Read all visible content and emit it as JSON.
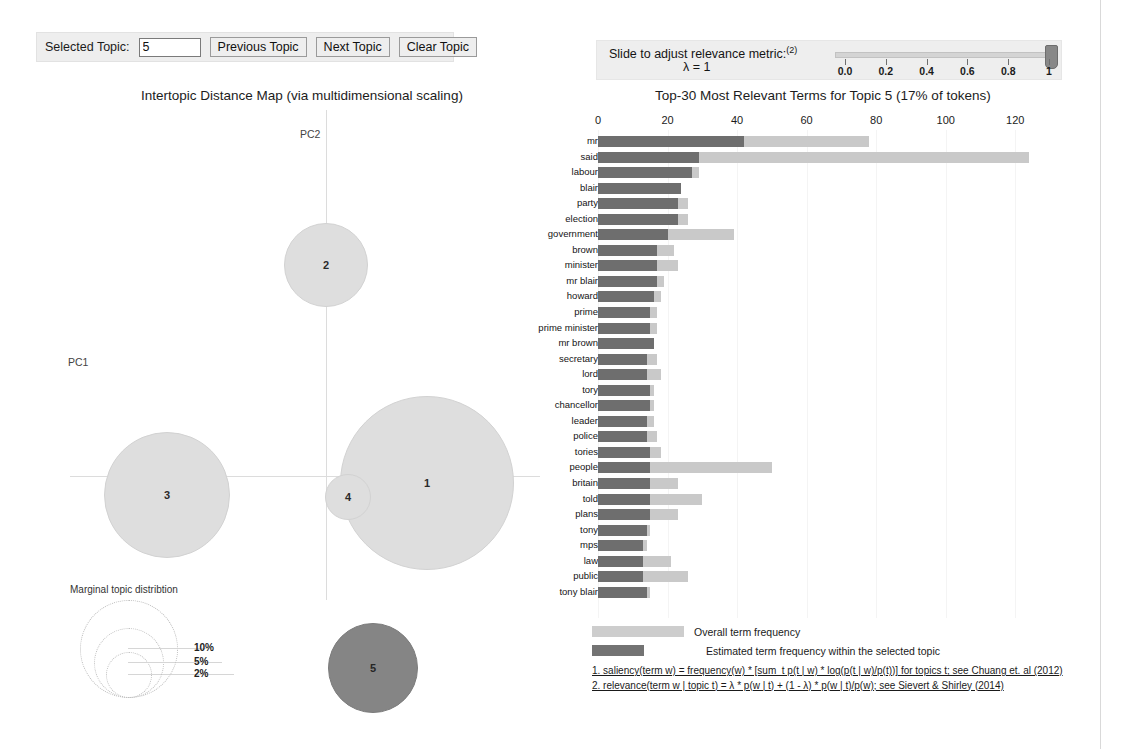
{
  "controls": {
    "selected_topic_label": "Selected Topic:",
    "selected_topic_value": "5",
    "previous_button": "Previous Topic",
    "next_button": "Next Topic",
    "clear_button": "Clear Topic"
  },
  "slider": {
    "label": "Slide to adjust relevance metric:",
    "superscript": "(2)",
    "lambda_text": "λ = 1",
    "value": 1,
    "ticks": [
      "0.0",
      "0.2",
      "0.4",
      "0.6",
      "0.8",
      "1"
    ]
  },
  "idm": {
    "title": "Intertopic Distance Map (via multidimensional scaling)",
    "pc1_label": "PC1",
    "pc2_label": "PC2",
    "topics": [
      {
        "id": "1",
        "cx": 406,
        "cy": 378,
        "r": 86,
        "selected": false
      },
      {
        "id": "2",
        "cx": 305,
        "cy": 160,
        "r": 41,
        "selected": false
      },
      {
        "id": "3",
        "cx": 146,
        "cy": 390,
        "r": 62,
        "selected": false
      },
      {
        "id": "4",
        "cx": 327,
        "cy": 392,
        "r": 22,
        "selected": false
      },
      {
        "id": "5",
        "cx": 352,
        "cy": 563,
        "r": 44,
        "selected": true
      }
    ],
    "marginal": {
      "title": "Marginal topic distribtion",
      "items": [
        {
          "label": "2%",
          "r": 22
        },
        {
          "label": "5%",
          "r": 34
        },
        {
          "label": "10%",
          "r": 48
        }
      ]
    }
  },
  "chart_data": {
    "type": "bar",
    "title": "Top-30 Most Relevant Terms for Topic 5 (17% of tokens)",
    "xlabel": "",
    "ylabel": "",
    "xlim": [
      0,
      130
    ],
    "xticks": [
      0,
      20,
      40,
      60,
      80,
      100,
      120
    ],
    "grid": false,
    "legend_position": "bottom",
    "orientation": "horizontal",
    "categories": [
      "mr",
      "said",
      "labour",
      "blair",
      "party",
      "election",
      "government",
      "brown",
      "minister",
      "mr blair",
      "howard",
      "prime",
      "prime minister",
      "mr brown",
      "secretary",
      "lord",
      "tory",
      "chancellor",
      "leader",
      "police",
      "tories",
      "people",
      "britain",
      "told",
      "plans",
      "tony",
      "mps",
      "law",
      "public",
      "tony blair"
    ],
    "series": [
      {
        "name": "Overall term frequency",
        "color": "#c9c9c9",
        "values": [
          78,
          124,
          29,
          24,
          26,
          26,
          39,
          22,
          23,
          19,
          18,
          17,
          17,
          16,
          17,
          18,
          16,
          16,
          16,
          17,
          18,
          50,
          23,
          30,
          23,
          15,
          14,
          21,
          26,
          15
        ]
      },
      {
        "name": "Estimated term frequency within the selected topic",
        "color": "#6e6e6e",
        "values": [
          42,
          29,
          27,
          24,
          23,
          23,
          20,
          17,
          17,
          17,
          16,
          15,
          15,
          16,
          14,
          14,
          15,
          15,
          14,
          14,
          15,
          15,
          15,
          15,
          15,
          14,
          13,
          13,
          13,
          14
        ]
      }
    ],
    "legend": [
      {
        "label": "Overall term frequency",
        "color": "#c9c9c9"
      },
      {
        "label": "Estimated term frequency within the selected topic",
        "color": "#6e6e6e"
      }
    ],
    "annotations": [
      "1. saliency(term w) = frequency(w) * [sum_t p(t | w) * log(p(t | w)/p(t))] for topics t; see Chuang et. al (2012)",
      "2. relevance(term w | topic t) = λ * p(w | t) + (1 - λ) * p(w | t)/p(w); see Sievert & Shirley (2014)"
    ]
  }
}
